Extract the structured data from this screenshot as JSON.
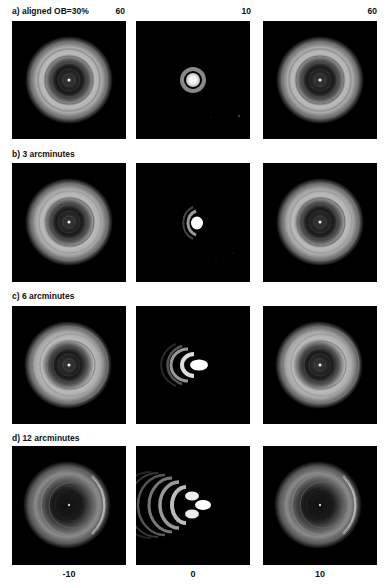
{
  "figure": {
    "rows": [
      {
        "label": "a) aligned OB=30%",
        "scales": [
          "60",
          "10",
          "60"
        ]
      },
      {
        "label": "b) 3 arcminutes",
        "scales": [
          "",
          "",
          ""
        ]
      },
      {
        "label": "c) 6 arcminutes",
        "scales": [
          "",
          "",
          ""
        ]
      },
      {
        "label": "d) 12 arcminutes",
        "scales": [
          "",
          "",
          ""
        ]
      }
    ],
    "columns": [
      {
        "focus_label": "-10"
      },
      {
        "focus_label": "0"
      },
      {
        "focus_label": "10"
      }
    ],
    "colors": {
      "background": "#ffffff",
      "panel_background": "#000000",
      "text": "#111111"
    }
  }
}
